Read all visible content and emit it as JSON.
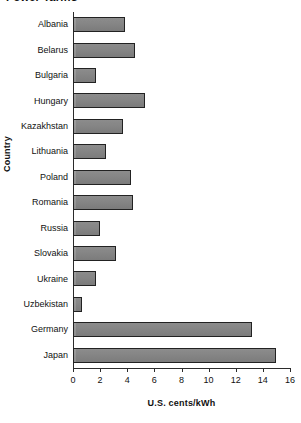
{
  "chart_data": {
    "type": "bar",
    "orientation": "horizontal",
    "title": "Power Tariffs",
    "xlabel": "U.S. cents/kWh",
    "ylabel": "Country",
    "xlim": [
      0,
      16
    ],
    "xticks": [
      0,
      2,
      4,
      6,
      8,
      10,
      12,
      14,
      16
    ],
    "grid": false,
    "legend": null,
    "bar_color": "#8a8a8a",
    "bar_edge_color": "#222222",
    "categories": [
      "Albania",
      "Belarus",
      "Bulgaria",
      "Hungary",
      "Kazakhstan",
      "Lithuania",
      "Poland",
      "Romania",
      "Russia",
      "Slovakia",
      "Ukraine",
      "Uzbekistan",
      "Germany",
      "Japan"
    ],
    "values": [
      3.8,
      4.6,
      1.7,
      5.3,
      3.7,
      2.4,
      4.3,
      4.4,
      2.0,
      3.2,
      1.7,
      0.7,
      13.2,
      15.0
    ]
  }
}
